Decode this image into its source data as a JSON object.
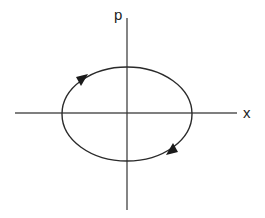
{
  "diagram": {
    "axes": {
      "horizontal_label": "x",
      "vertical_label": "p"
    },
    "orbit": {
      "shape": "ellipse",
      "direction": "clockwise",
      "arrows": 2
    },
    "colors": {
      "stroke": "#2a2a2a",
      "background": "#ffffff"
    }
  }
}
